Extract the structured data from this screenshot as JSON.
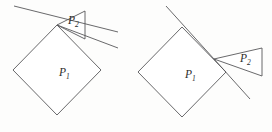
{
  "figure": {
    "background_color": "#fdfdfc",
    "stroke_color": "#58585a",
    "label_color": "#2b2b2b",
    "panels": [
      {
        "id": "left-panel",
        "name": "left-figure",
        "polygon_p1": {
          "label": "P",
          "subscript": "1",
          "label_x": 59,
          "label_y": 76,
          "vertices": "57,25 101,70 57,115 13,70",
          "description": "square rotated 45 degrees (diamond)"
        },
        "polygon_p2": {
          "label": "P",
          "subscript": "2",
          "label_x": 68,
          "label_y": 24,
          "vertices": "57,25 85,11 85,39",
          "description": "thin wedge with apex at top vertex of diamond"
        },
        "tangent_line_upper": "14,6 118,32",
        "tangent_line_lower": "57,25 118,48",
        "wedge_top_edge": "57,25 85,11",
        "wedge_right_edge": "85,11 85,39",
        "wedge_bottom_edge": "57,25 85,39"
      },
      {
        "id": "right-panel",
        "name": "right-figure",
        "polygon_p1": {
          "label": "P",
          "subscript": "1",
          "label_x": 185,
          "label_y": 78,
          "vertices": "182,27 226,72 182,117 138,72",
          "description": "square rotated 45 degrees (diamond)"
        },
        "polygon_p2": {
          "label": "P",
          "subscript": "2",
          "label_x": 240,
          "label_y": 62,
          "vertices": "214,59 262,48 262,76",
          "description": "thin wedge attached to upper-right edge of diamond"
        },
        "tangent_line_upper": "166,6 214,59",
        "tangent_line_lower": "214,59 250,99",
        "wedge_top_edge": "214,59 262,48",
        "wedge_right_edge": "262,48 262,76",
        "wedge_bottom_edge": "214,59 262,76"
      }
    ]
  }
}
